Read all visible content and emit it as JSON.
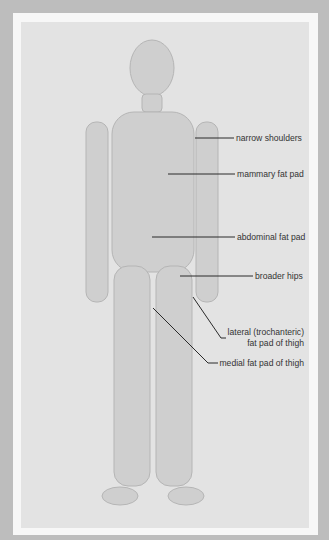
{
  "page": {
    "top_caption_cut": "FIGURE — female body features (cut off)",
    "colors": {
      "outer_background": "#bdbdbd",
      "frame": "#f7f7f7",
      "panel": "#e3e3e3",
      "label_text": "#333333",
      "leader_line": "#2a2a2a"
    }
  },
  "labels": [
    {
      "id": "narrow-shoulders",
      "text": "narrow shoulders"
    },
    {
      "id": "mammary-fat-pad",
      "text": "mammary fat pad"
    },
    {
      "id": "abdominal-fat-pad",
      "text": "abdominal fat pad"
    },
    {
      "id": "broader-hips",
      "text": "broader hips"
    },
    {
      "id": "lateral-fat-pad",
      "line1": "lateral (trochanteric)",
      "line2": "fat pad of thigh"
    },
    {
      "id": "medial-fat-pad",
      "text": "medial fat pad of thigh"
    }
  ]
}
